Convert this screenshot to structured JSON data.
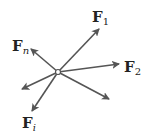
{
  "diagram": {
    "type": "concurrent-force-vectors",
    "origin": {
      "x": 58,
      "y": 72
    },
    "stroke_color": "#555555",
    "vectors": [
      {
        "id": "F1",
        "label": "F",
        "subscript": "1",
        "tip": {
          "x": 99,
          "y": 29
        }
      },
      {
        "id": "F2",
        "label": "F",
        "subscript": "2",
        "tip": {
          "x": 119,
          "y": 64
        }
      },
      {
        "id": "Fn",
        "label": "F",
        "subscript": "n",
        "tip": {
          "x": 31,
          "y": 49
        }
      },
      {
        "id": "Fi",
        "label": "F",
        "subscript": "i",
        "tip": {
          "x": 32,
          "y": 111
        }
      },
      {
        "id": "unlabeled-left",
        "label": "",
        "subscript": "",
        "tip": {
          "x": 22,
          "y": 89
        }
      },
      {
        "id": "unlabeled-right",
        "label": "",
        "subscript": "",
        "tip": {
          "x": 109,
          "y": 99
        }
      }
    ]
  },
  "labels": {
    "f1": {
      "main": "F",
      "sub": "1"
    },
    "f2": {
      "main": "F",
      "sub": "2"
    },
    "fn": {
      "main": "F",
      "sub": "n"
    },
    "fi": {
      "main": "F",
      "sub": "i"
    }
  }
}
